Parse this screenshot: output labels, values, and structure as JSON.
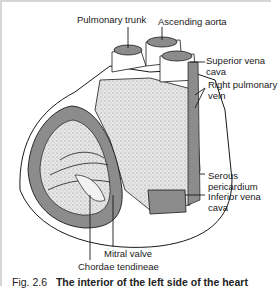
{
  "figure": {
    "number": "Fig. 2.6",
    "title": "The interior of the left side of the heart"
  },
  "labels": {
    "pulmonary_trunk": "Pulmonary trunk",
    "ascending_aorta": "Ascending aorta",
    "superior_vena_cava_1": "Superior vena",
    "superior_vena_cava_2": "cava",
    "right_pulmonary_vein_1": "Right pulmonary",
    "right_pulmonary_vein_2": "vein",
    "serous_pericardium_1": "Serous",
    "serous_pericardium_2": "pericardium",
    "inferior_vena_cava_1": "Inferior vena",
    "inferior_vena_cava_2": "cava",
    "mitral_valve": "Mitral valve",
    "chordae_tendineae": "Chordae tendineae"
  },
  "colors": {
    "line": "#1a1a1a",
    "muscle": "#8c8c8c",
    "stipple": "#d9d9d9",
    "frame": "#d6d6d6"
  }
}
